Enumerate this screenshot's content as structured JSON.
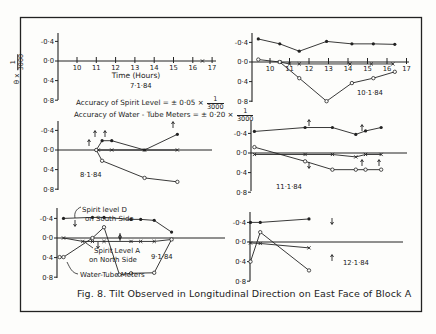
{
  "figure": {
    "caption": "Fig. 8. Tilt Observed in Longitudinal Direction on East Face of Block A",
    "y_axis_label": "θ x (1/3000)",
    "y_axis_label_parts": {
      "theta": "θ x",
      "num": "1",
      "den": "3000"
    },
    "x_axis_label": "Time (Hours)",
    "accuracy_spirit": {
      "text": "Accuracy of Spirit Level = ± 0·05 ×",
      "num": "1",
      "den": "3000"
    },
    "accuracy_water": {
      "text": "Accuracy of Water - Tube Meters = ± 0·20 ×",
      "num": "1",
      "den": "3000"
    },
    "annotations": {
      "spirit_d": [
        "Spirit level D",
        "on South Side"
      ],
      "spirit_a": [
        "Spirit Level A",
        "on North Side"
      ],
      "water_tube": "Water-Tube Meters"
    },
    "colors": {
      "ink": "#222222",
      "paper": "#fdfdfb"
    }
  },
  "chart_data": [
    {
      "type": "line",
      "title": "7·1·84",
      "xlabel": "Time (Hours)",
      "ylabel": "θ × 1/3000",
      "x_ticks": [
        "10",
        "11",
        "12",
        "13",
        "14",
        "15",
        "16",
        "17"
      ],
      "y_ticks": [
        "-0·4",
        "0·0",
        "0·4",
        "0·8"
      ],
      "ylim": [
        -0.4,
        0.8
      ],
      "y_inverted": true,
      "series": [
        {
          "name": "Spirit Level A (North Side)",
          "marker": "x",
          "x": [
            16.5
          ],
          "y": [
            0.0
          ]
        }
      ]
    },
    {
      "type": "line",
      "title": "10·1·84",
      "x_ticks": [
        "10",
        "11",
        "12",
        "13",
        "14",
        "15",
        "16",
        "17"
      ],
      "y_ticks": [
        "-0·4",
        "0·0",
        "0·4",
        "0·8"
      ],
      "ylim": [
        -0.4,
        0.8
      ],
      "y_inverted": true,
      "series": [
        {
          "name": "Spirit Level D (South Side)",
          "marker": "filled",
          "x": [
            9.4,
            10.5,
            11.5,
            12.9,
            14.2,
            15.3,
            16.4
          ],
          "y": [
            -0.47,
            -0.37,
            -0.22,
            -0.42,
            -0.37,
            -0.37,
            -0.36
          ]
        },
        {
          "name": "Spirit Level A (North Side)",
          "marker": "x",
          "x": [
            10.5,
            11.0,
            11.5,
            14.1,
            15.2,
            16.3
          ],
          "y": [
            0.0,
            0.04,
            0.04,
            0.04,
            0.04,
            0.04
          ]
        },
        {
          "name": "Water-Tube Meters",
          "marker": "open",
          "x": [
            9.4,
            10.5,
            11.5,
            12.9,
            14.2,
            15.3,
            16.4
          ],
          "y": [
            -0.05,
            0.0,
            0.33,
            0.8,
            0.43,
            0.33,
            0.2
          ]
        }
      ]
    },
    {
      "type": "line",
      "title": "8·1·84",
      "x_ticks": [],
      "y_ticks": [
        "-0·4",
        "0·0",
        "0·4",
        "0·8"
      ],
      "ylim": [
        -0.4,
        0.8
      ],
      "y_inverted": true,
      "series": [
        {
          "name": "Spirit Level D (South Side)",
          "marker": "filled",
          "x": [
            11.0,
            11.3,
            11.8,
            13.5,
            15.2
          ],
          "y": [
            0.0,
            -0.19,
            -0.19,
            0.0,
            -0.32
          ]
        },
        {
          "name": "Spirit Level A (North Side)",
          "marker": "x",
          "x": [
            11.1,
            11.8,
            13.5,
            15.2
          ],
          "y": [
            0.0,
            0.0,
            0.0,
            0.0
          ]
        },
        {
          "name": "Water-Tube Meters",
          "marker": "open",
          "x": [
            11.0,
            11.3,
            13.5,
            15.2
          ],
          "y": [
            0.0,
            0.22,
            0.57,
            0.65
          ]
        }
      ]
    },
    {
      "type": "line",
      "title": "11·1·84",
      "x_ticks": [],
      "y_ticks": [
        "-0·4",
        "0·0",
        "0·4",
        "0·8"
      ],
      "ylim": [
        -0.4,
        0.8
      ],
      "y_inverted": true,
      "series": [
        {
          "name": "Spirit Level D (South Side)",
          "marker": "filled",
          "x": [
            9.2,
            11.8,
            13.2,
            14.4,
            14.9,
            15.7
          ],
          "y": [
            -0.44,
            -0.52,
            -0.52,
            -0.38,
            -0.45,
            -0.52
          ]
        },
        {
          "name": "Spirit Level A (North Side)",
          "marker": "x",
          "x": [
            9.2,
            11.8,
            13.2,
            14.4,
            14.9,
            15.7
          ],
          "y": [
            0.03,
            0.03,
            0.03,
            0.08,
            0.03,
            0.03
          ]
        },
        {
          "name": "Water-Tube Meters",
          "marker": "open",
          "x": [
            9.2,
            11.8,
            13.2,
            14.4,
            14.9,
            15.7
          ],
          "y": [
            -0.12,
            0.17,
            0.34,
            0.34,
            0.34,
            0.34
          ]
        }
      ]
    },
    {
      "type": "line",
      "title": "9·1·84",
      "x_ticks": [],
      "y_ticks": [
        "-0·4",
        "0·0",
        "0·4",
        "0·8"
      ],
      "ylim": [
        -0.4,
        0.8
      ],
      "y_inverted": true,
      "series": [
        {
          "name": "Spirit Level D (South Side)",
          "marker": "filled",
          "x": [
            9.3,
            10.8,
            11.4,
            12.8,
            13.3,
            14.0,
            14.9
          ],
          "y": [
            -0.4,
            -0.42,
            -0.42,
            -0.38,
            -0.38,
            -0.36,
            -0.12
          ]
        },
        {
          "name": "Spirit Level A (North Side)",
          "marker": "x",
          "x": [
            9.3,
            10.3,
            10.8,
            11.4,
            12.8,
            13.3,
            14.0,
            14.9
          ],
          "y": [
            0.0,
            0.07,
            0.07,
            0.07,
            0.07,
            0.07,
            0.07,
            0.03
          ]
        },
        {
          "name": "Water-Tube Meters",
          "marker": "open",
          "x": [
            9.1,
            9.3,
            10.8,
            11.4,
            12.2,
            12.8,
            14.0,
            14.9
          ],
          "y": [
            0.39,
            0.39,
            0.0,
            -0.22,
            0.75,
            0.72,
            0.71,
            0.03
          ]
        }
      ]
    },
    {
      "type": "line",
      "title": "12·1·84",
      "x_ticks": [],
      "y_ticks": [
        "-0·4",
        "0·0",
        "0·4",
        "0·8"
      ],
      "ylim": [
        -0.4,
        0.8
      ],
      "y_inverted": true,
      "series": [
        {
          "name": "Spirit Level D (South Side)",
          "marker": "filled",
          "x": [
            9.0,
            9.5,
            12.0
          ],
          "y": [
            -0.4,
            -0.4,
            -0.47
          ]
        },
        {
          "name": "Spirit Level A (North Side)",
          "marker": "x",
          "x": [
            9.0,
            9.5,
            12.0
          ],
          "y": [
            0.02,
            0.03,
            0.12
          ]
        },
        {
          "name": "Water-Tube Meters",
          "marker": "open",
          "x": [
            9.0,
            9.5,
            12.0
          ],
          "y": [
            0.4,
            -0.2,
            0.58
          ]
        }
      ]
    }
  ]
}
